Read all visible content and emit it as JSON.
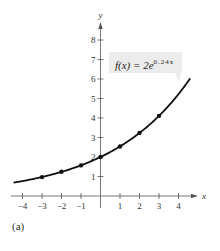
{
  "chart_data": {
    "type": "line",
    "title": "",
    "function_label": {
      "prefix": "f(x) = 2e",
      "exponent": "0.24x"
    },
    "function": "f(x) = 2e^(0.24x)",
    "xlabel": "x",
    "ylabel": "y",
    "xlim": [
      -4.5,
      4.9
    ],
    "ylim": [
      0,
      8.9
    ],
    "x_ticks": [
      -4,
      -3,
      -2,
      -1,
      1,
      2,
      3,
      4
    ],
    "x_tick_labels": [
      "−4",
      "−3",
      "−2",
      "−1",
      "1",
      "2",
      "3",
      "4"
    ],
    "y_ticks": [
      1,
      2,
      3,
      4,
      5,
      6,
      7,
      8
    ],
    "y_tick_labels": [
      "1",
      "2",
      "3",
      "4",
      "5",
      "6",
      "7",
      "8"
    ],
    "grid": false,
    "points": {
      "x": [
        -3,
        -2,
        -1,
        0,
        1,
        2,
        3
      ],
      "y": [
        0.97,
        1.24,
        1.57,
        2.0,
        2.54,
        3.23,
        4.11
      ]
    },
    "curve_domain": [
      -4.46,
      4.6
    ],
    "caption": "(a)"
  }
}
